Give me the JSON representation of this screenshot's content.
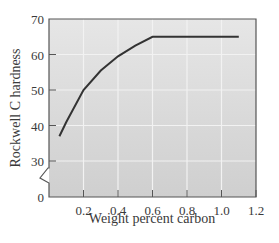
{
  "chart_data": {
    "type": "line",
    "title": "",
    "xlabel": "Weight percent carbon",
    "ylabel": "Rockwell C hardness",
    "xlim": [
      0,
      1.2
    ],
    "ylim": [
      0,
      70
    ],
    "y_axis_break": {
      "from": 0,
      "to": 30
    },
    "grid": true,
    "legend": null,
    "x_ticks": [
      "0.2",
      "0.4",
      "0.6",
      "0.8",
      "1.0",
      "1.2"
    ],
    "y_ticks": [
      "0",
      "30",
      "40",
      "50",
      "60",
      "70"
    ],
    "series": [
      {
        "name": "Hardness",
        "x": [
          0.06,
          0.1,
          0.2,
          0.3,
          0.4,
          0.5,
          0.6,
          0.8,
          1.0,
          1.1
        ],
        "y": [
          37,
          41,
          50,
          55.5,
          59.5,
          62.5,
          65,
          65,
          65,
          65
        ]
      }
    ]
  },
  "colors": {
    "plot_background": "#d4d4d4",
    "gridline": "#f2f2f2",
    "line": "#333333",
    "frame": "#555555"
  }
}
